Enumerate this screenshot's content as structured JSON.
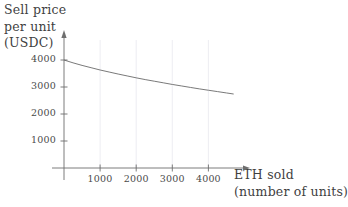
{
  "chart_data": {
    "type": "line",
    "title": "",
    "subtitle": "",
    "ylabel_lines": [
      "Sell price",
      "per unit",
      "(USDC)"
    ],
    "xlabel_lines": [
      "ETH sold",
      "(number of units)"
    ],
    "ylabel": "Sell price per unit (USDC)",
    "xlabel": "ETH sold (number of units)",
    "x_ticks": [
      1000,
      2000,
      3000,
      4000
    ],
    "x_tick_labels": [
      "1000",
      "2000",
      "3000",
      "4000"
    ],
    "y_ticks": [
      1000,
      2000,
      3000,
      4000
    ],
    "y_tick_labels": [
      "1000",
      "2000",
      "3000",
      "4000"
    ],
    "xlim": [
      0,
      5100
    ],
    "ylim": [
      0,
      4600
    ],
    "grid": "vertical-only",
    "legend": "none",
    "series": [
      {
        "name": "sell price curve",
        "color": "#6a6a6a",
        "x": [
          0,
          250,
          500,
          750,
          1000,
          1250,
          1500,
          1750,
          2000,
          2250,
          2500,
          2750,
          3000,
          3250,
          3500,
          3750,
          4000,
          4250,
          4500,
          4700
        ],
        "y": [
          4000,
          3895,
          3800,
          3715,
          3630,
          3555,
          3480,
          3410,
          3340,
          3275,
          3215,
          3155,
          3095,
          3040,
          2985,
          2930,
          2880,
          2830,
          2780,
          2740
        ]
      }
    ]
  },
  "axis_geometry": {
    "origin_x": 64,
    "origin_y": 168,
    "x_pixels_per_unit": 0.0361,
    "y_pixels_per_unit": 0.027
  }
}
